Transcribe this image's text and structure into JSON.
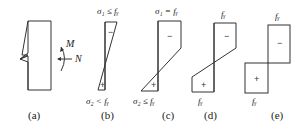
{
  "panels": [
    {
      "id": "a",
      "label": "(a)",
      "moment_label": "M",
      "axial_label": "N"
    },
    {
      "id": "b",
      "label": "(b)",
      "top_stress": "σ₁ ≤ fᵧ",
      "bottom_stress": "σ₂ < fᵧ",
      "top_sign": "−",
      "bottom_sign": "+"
    },
    {
      "id": "c",
      "label": "(c)",
      "top_stress": "σ₁ = fᵧ",
      "bottom_stress": "σ₂ ≤ fᵧ",
      "top_sign": "−",
      "bottom_sign": "+"
    },
    {
      "id": "d",
      "label": "(d)",
      "top_stress": "fᵧ",
      "bottom_stress": "fᵧ",
      "top_sign": "−",
      "bottom_sign": "+"
    },
    {
      "id": "e",
      "label": "(e)",
      "top_stress": "fᵧ",
      "bottom_stress": "fᵧ",
      "top_sign": "−",
      "bottom_sign": "+"
    }
  ]
}
